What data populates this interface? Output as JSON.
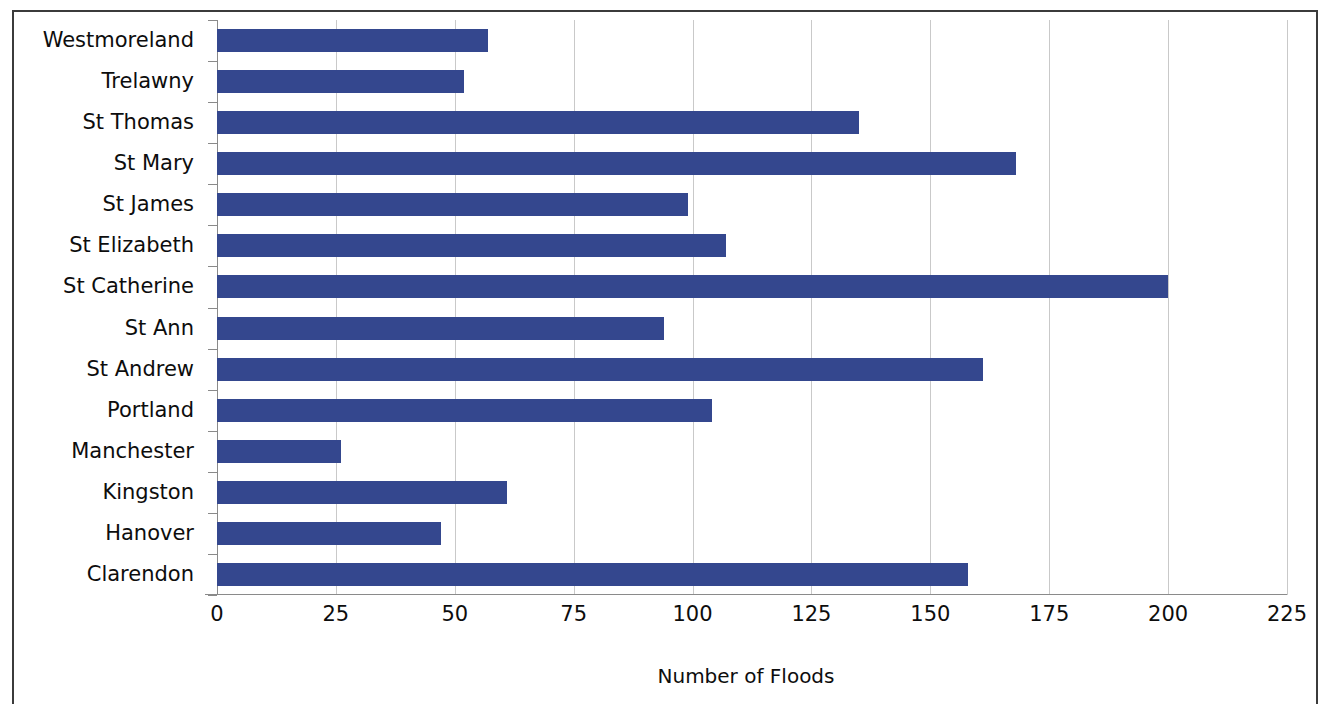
{
  "chart_data": {
    "type": "bar",
    "orientation": "horizontal",
    "title": "",
    "xlabel": "Number of Floods",
    "ylabel": "",
    "xlim": [
      0,
      225
    ],
    "xticks": [
      0,
      25,
      50,
      75,
      100,
      125,
      150,
      175,
      200,
      225
    ],
    "xtick_labels": [
      "0",
      "25",
      "50",
      "75",
      "100",
      "125",
      "150",
      "175",
      "200",
      "225"
    ],
    "grid": "vertical",
    "legend": "none",
    "bar_color": "#34478E",
    "gridline_color": "#C9C9C9",
    "axis_color": "#8A8A8A",
    "border_color": "#3B3B3B",
    "categories": [
      "Westmoreland",
      "Trelawny",
      "St Thomas",
      "St Mary",
      "St James",
      "St Elizabeth",
      "St Catherine",
      "St Ann",
      "St Andrew",
      "Portland",
      "Manchester",
      "Kingston",
      "Hanover",
      "Clarendon"
    ],
    "values": [
      57,
      52,
      135,
      168,
      99,
      107,
      200,
      94,
      161,
      104,
      26,
      61,
      47,
      158
    ],
    "series": [
      {
        "name": "Number of Floods",
        "values": [
          57,
          52,
          135,
          168,
          99,
          107,
          200,
          94,
          161,
          104,
          26,
          61,
          47,
          158
        ]
      }
    ]
  }
}
